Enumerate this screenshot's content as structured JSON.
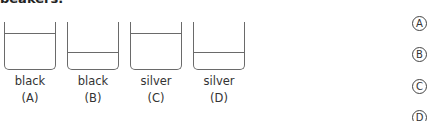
{
  "header": {
    "cutoff_text": "beakers."
  },
  "beakers": [
    {
      "id": "A",
      "color": "black",
      "letter": "(A)",
      "water_level": "high"
    },
    {
      "id": "B",
      "color": "black",
      "letter": "(B)",
      "water_level": "low"
    },
    {
      "id": "C",
      "color": "silver",
      "letter": "(C)",
      "water_level": "high"
    },
    {
      "id": "D",
      "color": "silver",
      "letter": "(D)",
      "water_level": "low"
    }
  ],
  "options": [
    {
      "label": "A"
    },
    {
      "label": "B"
    },
    {
      "label": "C"
    },
    {
      "label": "D"
    }
  ]
}
